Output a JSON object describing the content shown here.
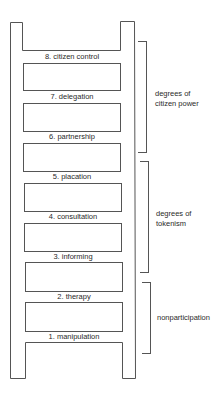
{
  "diagram": {
    "type": "ladder",
    "rungs": [
      {
        "level": 8,
        "label": "8. citizen control"
      },
      {
        "level": 7,
        "label": "7. delegation"
      },
      {
        "level": 6,
        "label": "6. partnership"
      },
      {
        "level": 5,
        "label": "5. placation"
      },
      {
        "level": 4,
        "label": "4. consultation"
      },
      {
        "level": 3,
        "label": "3. informing"
      },
      {
        "level": 2,
        "label": "2. therapy"
      },
      {
        "level": 1,
        "label": "1. manipulation"
      }
    ],
    "groups": [
      {
        "label_line1": "degrees of",
        "label_line2": "citizen power",
        "levels": [
          8,
          7,
          6
        ]
      },
      {
        "label_line1": "degrees of",
        "label_line2": "tokenism",
        "levels": [
          5,
          4,
          3
        ]
      },
      {
        "label_line1": "nonparticipation",
        "label_line2": "",
        "levels": [
          2,
          1
        ]
      }
    ],
    "colors": {
      "line": "#555555",
      "text": "#2a2a2a",
      "background": "#ffffff"
    }
  }
}
